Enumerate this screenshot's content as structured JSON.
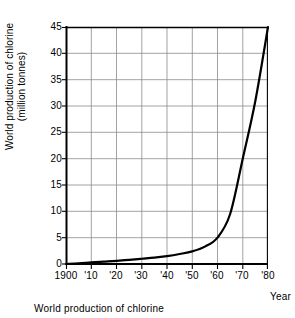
{
  "chart_data": {
    "type": "line",
    "title": "",
    "caption": "World production of chlorine",
    "xlabel": "Year",
    "ylabel_line1": "World production of chlorine",
    "ylabel_line2": "(million tonnes)",
    "xlim": [
      1900,
      1980
    ],
    "ylim": [
      0,
      45
    ],
    "grid": true,
    "legend_position": "none",
    "x_tick_labels": [
      "1900",
      "'10",
      "'20",
      "'30",
      "'40",
      "'50",
      "'60",
      "'70",
      "'80"
    ],
    "x_tick_values": [
      1900,
      1910,
      1920,
      1930,
      1940,
      1950,
      1960,
      1970,
      1980
    ],
    "y_tick_labels": [
      "0",
      "5",
      "10",
      "15",
      "20",
      "25",
      "30",
      "35",
      "40",
      "45"
    ],
    "y_tick_values": [
      0,
      5,
      10,
      15,
      20,
      25,
      30,
      35,
      40,
      45
    ],
    "series": [
      {
        "name": "World production of chlorine",
        "color": "#000000",
        "x": [
          1900,
          1905,
          1910,
          1915,
          1920,
          1925,
          1930,
          1935,
          1940,
          1945,
          1950,
          1955,
          1960,
          1965,
          1970,
          1975,
          1980
        ],
        "values": [
          0.0,
          0.1,
          0.3,
          0.45,
          0.6,
          0.8,
          1.0,
          1.2,
          1.5,
          1.9,
          2.4,
          3.3,
          5.0,
          9.5,
          20.0,
          31.0,
          45.0
        ]
      }
    ]
  },
  "colors": {
    "grid": "#8a8a8a",
    "axis": "#000000",
    "curve": "#000000",
    "background": "#ffffff"
  }
}
